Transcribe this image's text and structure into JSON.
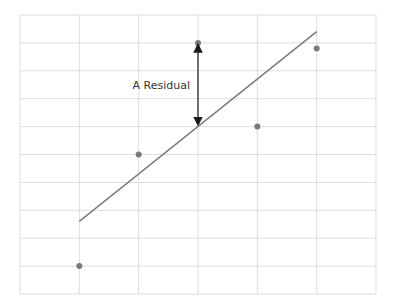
{
  "chart_data": {
    "type": "scatter",
    "title": "",
    "xlabel": "",
    "ylabel": "",
    "xlim": [
      0,
      6
    ],
    "ylim": [
      0,
      10
    ],
    "grid": true,
    "grid_x_divisions": 6,
    "grid_y_divisions": 10,
    "points": [
      {
        "x": 1,
        "y": 1
      },
      {
        "x": 2,
        "y": 5
      },
      {
        "x": 3,
        "y": 9
      },
      {
        "x": 4,
        "y": 6
      },
      {
        "x": 5,
        "y": 8.8
      }
    ],
    "regression_line": {
      "x1": 1,
      "y1": 2.6,
      "x2": 5,
      "y2": 9.4
    },
    "annotations": [
      {
        "type": "double-arrow",
        "x": 3,
        "y_from": 9,
        "y_to": 6.0,
        "label": "A Residual"
      }
    ],
    "colors": {
      "grid": "#dddddd",
      "point": "#7a7a7a",
      "line": "#7f7f7f",
      "arrow": "#1a1a1a",
      "text": "#333333"
    }
  },
  "annotation_label": "A Residual"
}
